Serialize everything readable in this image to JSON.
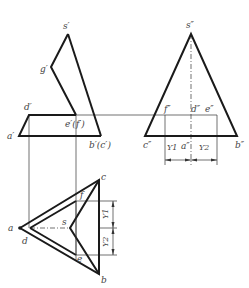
{
  "front_view": {
    "labels": {
      "s": "s′",
      "g": "g′",
      "d": "d′",
      "a": "a′",
      "ef": "e′(f′)",
      "bc": "b′(c′)"
    }
  },
  "side_view": {
    "labels": {
      "s": "s″",
      "f": "f″",
      "d": "d″",
      "e": "e″",
      "c": "c″",
      "a": "a″",
      "b": "b″",
      "y1": "Y1",
      "y2": "Y2"
    }
  },
  "top_view": {
    "labels": {
      "a": "a",
      "d": "d",
      "s": "s",
      "c": "c",
      "b": "b",
      "f": "f",
      "e": "e",
      "y1": "Y1",
      "y2": "Y2"
    }
  },
  "colors": {
    "outline": "#1a1a1a",
    "construction": "#333333",
    "label": "#444444"
  }
}
